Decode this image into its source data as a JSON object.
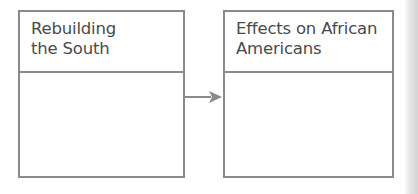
{
  "diagram": {
    "type": "flow",
    "boxes": [
      {
        "title_line1": "Rebuilding",
        "title_line2": "the South",
        "content": ""
      },
      {
        "title_line1": "Effects on African",
        "title_line2": "Americans",
        "content": ""
      }
    ],
    "connector": {
      "from": 0,
      "to": 1,
      "style": "arrow"
    },
    "colors": {
      "border": "#8a8a8a",
      "text": "#4a4a4a",
      "arrow": "#8a8a8a"
    }
  }
}
